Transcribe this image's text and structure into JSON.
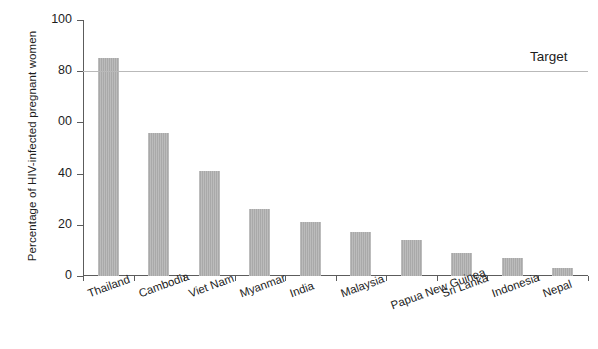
{
  "chart_data": {
    "type": "bar",
    "title": "",
    "subtitle": "",
    "xlabel": "",
    "ylabel": "Percentage of HIV-infected pregnant women",
    "ylim": [
      0,
      100
    ],
    "ytick_labels": [
      "0",
      "20",
      "40",
      "00",
      "80",
      "100"
    ],
    "ytick_values": [
      0,
      20,
      40,
      60,
      80,
      100
    ],
    "grid": false,
    "legend": "none",
    "bar_color": "#a9a9a9",
    "categories": [
      "Thailand",
      "Cambodia",
      "Viet Nam",
      "Myanmar",
      "India",
      "Malaysia",
      "Papua New Guinea",
      "Sri Lanka",
      "Indonesia",
      "Nepal"
    ],
    "values": [
      85,
      56,
      41,
      26,
      21,
      17,
      14,
      9,
      7,
      3
    ],
    "annotations": [
      {
        "name": "target-line",
        "label": "Target",
        "value": 80,
        "color": "#b9b9b9"
      }
    ]
  }
}
